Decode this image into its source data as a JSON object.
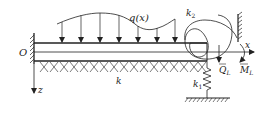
{
  "diagram": {
    "labels": {
      "origin": "O",
      "x_axis": "x",
      "z_axis": "z",
      "load": "q(x)",
      "foundation_stiffness": "k",
      "translational_spring": "k",
      "translational_spring_sub": "1",
      "rotational_spring": "k",
      "rotational_spring_sub": "2",
      "shear_force": "Q",
      "shear_force_sub": "L",
      "moment": "M",
      "moment_sub": "L"
    },
    "colors": {
      "stroke": "#222222",
      "background": "#ffffff"
    }
  }
}
